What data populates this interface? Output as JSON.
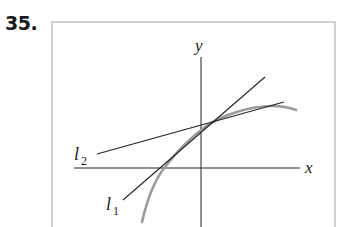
{
  "problem": {
    "number": "35."
  },
  "diagram": {
    "axes": {
      "x_label": "x",
      "y_label": "y"
    },
    "lines": [
      {
        "name": "l1",
        "base": "l",
        "subscript": "1"
      },
      {
        "name": "l2",
        "base": "l",
        "subscript": "2"
      }
    ],
    "curve": {
      "color": "#9a9a9a"
    },
    "colors": {
      "frame": "#b5b5b5",
      "axes": "#222222",
      "lines": "#222222"
    }
  }
}
